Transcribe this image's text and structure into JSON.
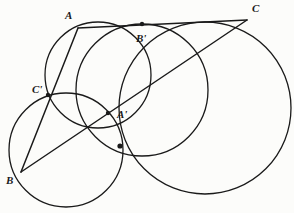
{
  "figure": {
    "background_color": "#fcfcfa",
    "stroke_color": "#1a1a1a",
    "label_color": "#1a1a1a",
    "width": 294,
    "height": 213
  },
  "points": [
    {
      "id": "A",
      "label": "A",
      "x": 78,
      "y": 28,
      "label_x": 65,
      "label_y": 10,
      "kind": "vertex"
    },
    {
      "id": "B",
      "label": "B",
      "x": 21,
      "y": 172,
      "label_x": 6,
      "label_y": 175,
      "kind": "vertex"
    },
    {
      "id": "C",
      "label": "C",
      "x": 247,
      "y": 20,
      "label_x": 252,
      "label_y": 3,
      "kind": "vertex"
    },
    {
      "id": "Ap",
      "label": "A'",
      "x": 108,
      "y": 113,
      "label_x": 117,
      "label_y": 109,
      "kind": "intersection"
    },
    {
      "id": "Bp",
      "label": "B'",
      "x": 142,
      "y": 24,
      "label_x": 136,
      "label_y": 33,
      "kind": "intersection"
    },
    {
      "id": "Cp",
      "label": "C'",
      "x": 48,
      "y": 95,
      "label_x": 32,
      "label_y": 84,
      "kind": "intersection"
    }
  ],
  "circles": [
    {
      "id": "circle-left-upper",
      "cx": 98,
      "cy": 75,
      "r": 53,
      "through": [
        "A",
        "C'",
        "A'",
        "B'"
      ]
    },
    {
      "id": "circle-middle",
      "cx": 142,
      "cy": 90,
      "r": 66,
      "through": [
        "B'",
        "A'"
      ]
    },
    {
      "id": "circle-lower-left",
      "cx": 66,
      "cy": 150,
      "r": 57,
      "through": [
        "B",
        "C'",
        "A'"
      ]
    },
    {
      "id": "circle-large-right",
      "cx": 205,
      "cy": 108,
      "r": 86,
      "through": [
        "C",
        "B'"
      ]
    }
  ],
  "lines": [
    {
      "id": "line-AB",
      "from": "A",
      "to": "B",
      "through": [
        "C'"
      ]
    },
    {
      "id": "line-AC",
      "from": "A",
      "to": "C",
      "through": [
        "B'"
      ]
    },
    {
      "id": "line-BC",
      "from": "B",
      "to": "C",
      "through": [
        "A'"
      ]
    }
  ],
  "nodes": [
    {
      "id": "node-Cp",
      "x": 48,
      "y": 95
    },
    {
      "id": "node-Ap",
      "x": 108,
      "y": 113
    },
    {
      "id": "node-Bp",
      "x": 142,
      "y": 24
    },
    {
      "id": "node-lower",
      "x": 120,
      "y": 146
    }
  ]
}
